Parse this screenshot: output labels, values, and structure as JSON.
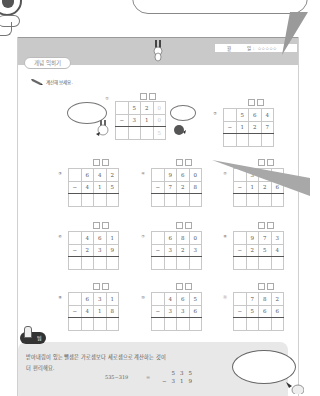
{
  "header": {
    "title_badge": "개념 익히기",
    "mascot_caption": "",
    "date": {
      "month_label": "월",
      "day_label": "일",
      "separator": ":",
      "stars": "☆☆☆☆☆"
    }
  },
  "instruction": {
    "icon": "pencil-icon",
    "text": "계산해 보세요."
  },
  "problem_1_caption": "",
  "problems": [
    {
      "num": "①",
      "top": [
        "",
        "5",
        "2",
        ""
      ],
      "bottom": [
        "−",
        "3",
        "1",
        ""
      ],
      "answer": [
        "",
        "",
        "",
        ""
      ]
    },
    {
      "num": "②",
      "top": [
        "",
        "5",
        "6",
        "4"
      ],
      "bottom": [
        "−",
        "1",
        "2",
        "7"
      ],
      "answer": [
        "",
        "",
        "",
        ""
      ]
    },
    {
      "num": "③",
      "top": [
        "",
        "6",
        "4",
        "2"
      ],
      "bottom": [
        "−",
        "4",
        "1",
        "5"
      ],
      "answer": [
        "",
        "",
        "",
        ""
      ]
    },
    {
      "num": "④",
      "top": [
        "",
        "9",
        "6",
        "0"
      ],
      "bottom": [
        "−",
        "7",
        "2",
        "8"
      ],
      "answer": [
        "",
        "",
        "",
        ""
      ]
    },
    {
      "num": "⑤",
      "top": [
        "",
        "3",
        "",
        ""
      ],
      "bottom": [
        "−",
        "1",
        "2",
        "6"
      ],
      "answer": [
        "",
        "",
        "",
        ""
      ]
    },
    {
      "num": "⑥",
      "top": [
        "",
        "4",
        "6",
        "1"
      ],
      "bottom": [
        "−",
        "2",
        "3",
        "9"
      ],
      "answer": [
        "",
        "",
        "",
        ""
      ]
    },
    {
      "num": "⑦",
      "top": [
        "",
        "6",
        "8",
        "0"
      ],
      "bottom": [
        "−",
        "3",
        "2",
        "3"
      ],
      "answer": [
        "",
        "",
        "",
        ""
      ]
    },
    {
      "num": "⑧",
      "top": [
        "",
        "9",
        "7",
        "3"
      ],
      "bottom": [
        "−",
        "2",
        "5",
        "4"
      ],
      "answer": [
        "",
        "",
        "",
        ""
      ]
    },
    {
      "num": "⑨",
      "top": [
        "",
        "6",
        "3",
        "1"
      ],
      "bottom": [
        "−",
        "4",
        "1",
        "8"
      ],
      "answer": [
        "",
        "",
        "",
        ""
      ]
    },
    {
      "num": "⑩",
      "top": [
        "",
        "4",
        "6",
        "5"
      ],
      "bottom": [
        "−",
        "3",
        "3",
        "6"
      ],
      "answer": [
        "",
        "",
        "",
        ""
      ]
    },
    {
      "num": "⑪",
      "top": [
        "",
        "7",
        "8",
        "2"
      ],
      "bottom": [
        "−",
        "5",
        "6",
        "6"
      ],
      "answer": [
        "",
        "",
        "",
        ""
      ]
    }
  ],
  "speech_bubbles": {
    "left_of_problem_1": "",
    "right_of_problem_1": ""
  },
  "tip": {
    "badge": "팁",
    "text_line1": "받아내림이 있는 뺄셈은 가로셈보다 세로셈으로 계산하는 것이",
    "text_line2": "더 편리해요.",
    "example_horizontal": "535−319",
    "example_equals": "=",
    "example_vertical": {
      "top": [
        "5",
        "3",
        "5"
      ],
      "bottom_op": "−",
      "bottom": [
        "3",
        "1",
        "9"
      ]
    },
    "bubble": ""
  }
}
